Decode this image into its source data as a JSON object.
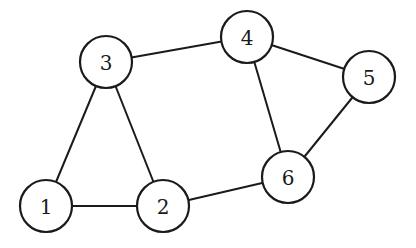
{
  "graph": {
    "nodes": [
      {
        "id": "1",
        "label": "1",
        "x": 46,
        "y": 206
      },
      {
        "id": "2",
        "label": "2",
        "x": 163,
        "y": 206
      },
      {
        "id": "3",
        "label": "3",
        "x": 106,
        "y": 62
      },
      {
        "id": "4",
        "label": "4",
        "x": 247,
        "y": 37
      },
      {
        "id": "5",
        "label": "5",
        "x": 369,
        "y": 77
      },
      {
        "id": "6",
        "label": "6",
        "x": 288,
        "y": 177
      }
    ],
    "edges": [
      [
        "1",
        "2"
      ],
      [
        "1",
        "3"
      ],
      [
        "2",
        "3"
      ],
      [
        "3",
        "4"
      ],
      [
        "4",
        "5"
      ],
      [
        "4",
        "6"
      ],
      [
        "5",
        "6"
      ],
      [
        "2",
        "6"
      ]
    ],
    "node_radius": 26,
    "colors": {
      "stroke": "#1a1a1a",
      "fill": "#ffffff"
    }
  }
}
